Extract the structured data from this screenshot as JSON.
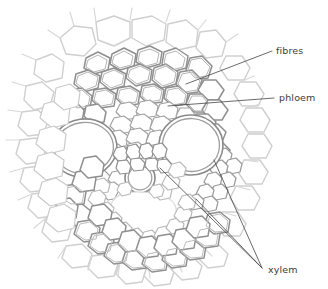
{
  "figure": {
    "type": "biological-cross-section-diagram",
    "background_color": "#ffffff",
    "width": 328,
    "height": 289
  },
  "colors": {
    "cell_wall_dark": "#8a8a8a",
    "cell_wall_mid": "#a8a8a8",
    "cell_wall_light": "#c8c8c8",
    "cell_wall_faint": "#dcdcdc",
    "vessel_outline": "#777777",
    "leader_line": "#444444",
    "label_text": "#3c3c3c",
    "cell_fill": "#ffffff"
  },
  "labels": [
    {
      "id": "fibres",
      "text": "fibres",
      "text_x": 276,
      "text_y": 54,
      "leader": [
        [
          272,
          51
        ],
        [
          186,
          84
        ]
      ],
      "anchor": "start"
    },
    {
      "id": "phloem",
      "text": "phloem",
      "text_x": 279,
      "text_y": 101,
      "leader": [
        [
          274,
          98
        ],
        [
          168,
          106
        ]
      ],
      "anchor": "start"
    },
    {
      "id": "xylem",
      "text": "xylem",
      "text_x": 268,
      "text_y": 273,
      "leader_group": [
        [
          [
            262,
            268
          ],
          [
            160,
            168
          ]
        ],
        [
          [
            262,
            268
          ],
          [
            196,
            199
          ]
        ],
        [
          [
            262,
            268
          ],
          [
            214,
            160
          ]
        ]
      ],
      "anchor": "start"
    }
  ],
  "structures": {
    "large_vessel_left": {
      "name": "left-metaxylem-vessel",
      "cx": 84,
      "cy": 148,
      "rx": 31,
      "ry": 27,
      "rotation": -8
    },
    "large_vessel_right": {
      "name": "right-metaxylem-vessel",
      "cx": 191,
      "cy": 145,
      "rx": 30,
      "ry": 28,
      "rotation": 4
    },
    "small_vessel_center": {
      "name": "central-protoxylem-vessel",
      "cx": 140,
      "cy": 178,
      "rx": 14,
      "ry": 14,
      "rotation": 0
    },
    "lacuna": {
      "name": "central-lacuna-air-space",
      "cx": 143,
      "cy": 213,
      "rx": 34,
      "ry": 20,
      "rotation": 0
    }
  },
  "regions": [
    {
      "id": "fibres-cap",
      "name": "sclerenchyma-fibre-cap",
      "description": "thick-walled small cells forming outer ring"
    },
    {
      "id": "phloem",
      "name": "phloem-tissue",
      "description": "small thin-walled sieve tubes and companion cells"
    },
    {
      "id": "xylem",
      "name": "xylem-tissue",
      "description": "large vessels plus tracheids"
    },
    {
      "id": "parenchyma",
      "name": "ground-parenchyma",
      "description": "large rounded thin-walled cells at periphery"
    }
  ]
}
